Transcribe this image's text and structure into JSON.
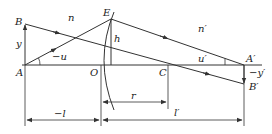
{
  "diagram": {
    "type": "optics single spherical refracting surface",
    "colors": {
      "line": "#333333",
      "background": "#ffffff"
    },
    "points": {
      "A": "A",
      "B": "B",
      "E": "E",
      "O": "O",
      "C": "C",
      "A_prime": "A′",
      "B_prime": "B′"
    },
    "media": {
      "object_side": "n",
      "image_side": "n′"
    },
    "quantities": {
      "object_height": "y",
      "image_height": "−y′",
      "ray_height": "h",
      "object_angle": "−u",
      "image_angle": "u′",
      "object_distance": "−l",
      "image_distance": "l′",
      "radius": "r"
    }
  }
}
